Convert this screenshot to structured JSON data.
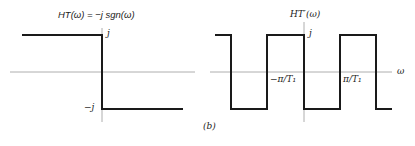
{
  "figure": {
    "caption": "(b)",
    "left_plot": {
      "title": "HT(ω) = −j sgn(ω)",
      "upper_level_label": "j",
      "lower_level_label": "−j",
      "axis_color": "#888888",
      "line_color": "#1a1a1a"
    },
    "right_plot": {
      "title": "HT′(ω)",
      "upper_level_label": "j",
      "x_axis_label": "ω",
      "tick_neg": "−π/T₁",
      "tick_pos": "π/T₁",
      "axis_color": "#888888",
      "line_color": "#1a1a1a"
    }
  }
}
